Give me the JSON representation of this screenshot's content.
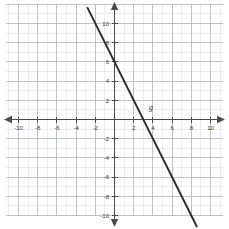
{
  "graph": {
    "title": "",
    "line_label": "g"
  },
  "axes": {
    "x_axis_name": "x-axis",
    "y_axis_name": "y-axis",
    "x_tick_labels": [
      "-10",
      "-8",
      "-6",
      "-4",
      "-2",
      "2",
      "4",
      "6",
      "8",
      "10"
    ],
    "y_tick_labels": [
      "10",
      "8",
      "6",
      "4",
      "2",
      "-2",
      "-4",
      "-6",
      "-8",
      "-10"
    ]
  },
  "colors": {
    "minor_grid": "#d8dde3",
    "major_grid": "#a8b0b8",
    "axis": "#4a4a55",
    "line": "#2b2b2b",
    "label_text": "#3a3a3a",
    "background": "#ffffff"
  },
  "chart_data": {
    "type": "line",
    "title": "",
    "xlabel": "",
    "ylabel": "",
    "xlim": [
      -11,
      11
    ],
    "ylim": [
      -11,
      11
    ],
    "grid": true,
    "minor_grid_step": 1,
    "major_grid_step": 2,
    "legend": "none",
    "series": [
      {
        "name": "g",
        "equation": "y = -2x + 6",
        "slope": -2,
        "y_intercept": 6,
        "x_intercept": 3,
        "points": [
          {
            "x": -2.85,
            "y": 11.7
          },
          {
            "x": 0,
            "y": 6
          },
          {
            "x": 3,
            "y": 0
          },
          {
            "x": 8.6,
            "y": -11.2
          }
        ],
        "label": "g",
        "label_at": {
          "x": 3.6,
          "y": 1.0
        }
      }
    ],
    "x_ticks": [
      -10,
      -8,
      -6,
      -4,
      -2,
      2,
      4,
      6,
      8,
      10
    ],
    "y_ticks": [
      10,
      8,
      6,
      4,
      2,
      -2,
      -4,
      -6,
      -8,
      -10
    ],
    "annotations": [
      {
        "text": "g",
        "x": 3.6,
        "y": 1.0,
        "style": "italic"
      }
    ]
  }
}
